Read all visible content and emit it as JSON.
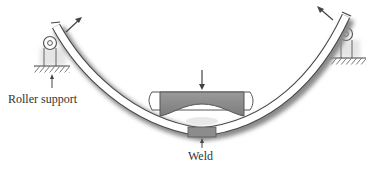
{
  "figure": {
    "labels": {
      "roller_support": "Roller support",
      "weld": "Weld"
    },
    "colors": {
      "beam_fill": "#ffffff",
      "beam_shadow": "#8a8a8a",
      "block_fill": "#8f8f8f",
      "ink": "#333333"
    }
  }
}
